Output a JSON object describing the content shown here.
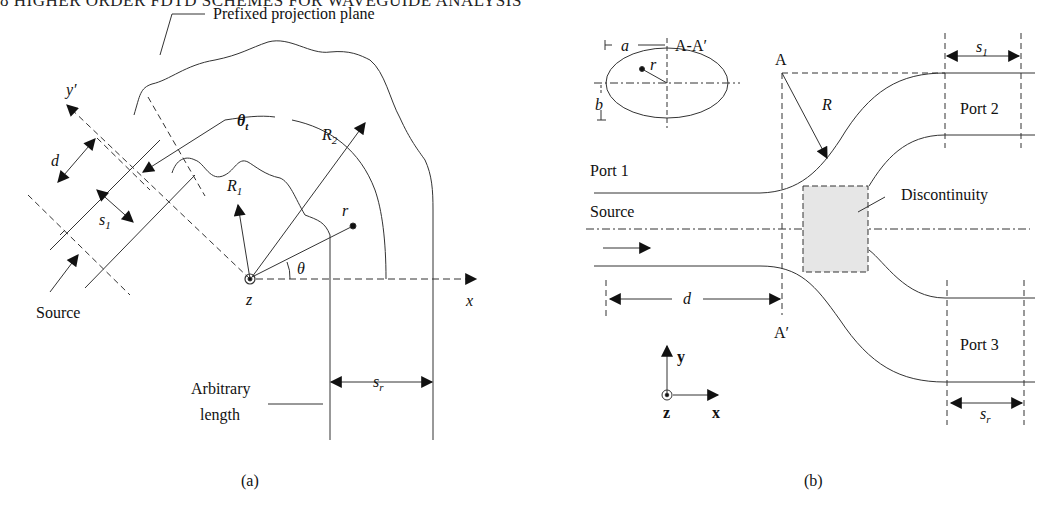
{
  "header": {
    "text": "8   HIGHER ORDER FDTD SCHEMES FOR WAVEGUIDE ANALYSIS"
  },
  "figure_a": {
    "caption": "(a)",
    "labels": {
      "projection_plane": "Prefixed projection plane",
      "y_prime": "y′",
      "theta_t": "θ",
      "theta_t_sub": "t",
      "R1": "R",
      "R1_sub": "1",
      "R2": "R",
      "R2_sub": "2",
      "r": "r",
      "theta": "θ",
      "d": "d",
      "s1": "s",
      "s1_sub": "1",
      "source": "Source",
      "z": "z",
      "x": "x",
      "sr": "s",
      "sr_sub": "r",
      "arbitrary_length_line1": "Arbitrary",
      "arbitrary_length_line2": "length"
    }
  },
  "figure_b": {
    "caption": "(b)",
    "labels": {
      "a": "a",
      "b": "b",
      "r": "r",
      "section": "A-A′",
      "A": "A",
      "A_prime": "A′",
      "R": "R",
      "port1": "Port 1",
      "port2": "Port 2",
      "port3": "Port 3",
      "source": "Source",
      "discontinuity": "Discontinuity",
      "d": "d",
      "s1": "s",
      "s1_sub": "1",
      "sr": "s",
      "sr_sub": "r",
      "axis_y": "y",
      "axis_x": "x",
      "axis_z": "z"
    },
    "colors": {
      "discontinuity_fill": "#e6e6e6"
    }
  }
}
